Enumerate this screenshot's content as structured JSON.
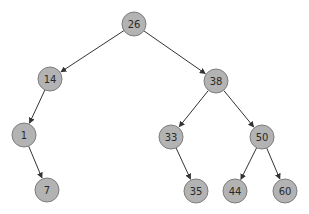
{
  "diagram": {
    "type": "binary-search-tree",
    "nodes": [
      {
        "id": "n26",
        "label": "26",
        "x": 134,
        "y": 24
      },
      {
        "id": "n14",
        "label": "14",
        "x": 50,
        "y": 79
      },
      {
        "id": "n38",
        "label": "38",
        "x": 216,
        "y": 81
      },
      {
        "id": "n1",
        "label": "1",
        "x": 24,
        "y": 135
      },
      {
        "id": "n33",
        "label": "33",
        "x": 171,
        "y": 137
      },
      {
        "id": "n50",
        "label": "50",
        "x": 262,
        "y": 137
      },
      {
        "id": "n7",
        "label": "7",
        "x": 47,
        "y": 190
      },
      {
        "id": "n35",
        "label": "35",
        "x": 196,
        "y": 191
      },
      {
        "id": "n44",
        "label": "44",
        "x": 235,
        "y": 191
      },
      {
        "id": "n60",
        "label": "60",
        "x": 285,
        "y": 191
      }
    ],
    "edges": [
      {
        "from": "n26",
        "to": "n14"
      },
      {
        "from": "n26",
        "to": "n38"
      },
      {
        "from": "n14",
        "to": "n1"
      },
      {
        "from": "n1",
        "to": "n7"
      },
      {
        "from": "n38",
        "to": "n33"
      },
      {
        "from": "n38",
        "to": "n50"
      },
      {
        "from": "n33",
        "to": "n35"
      },
      {
        "from": "n50",
        "to": "n44"
      },
      {
        "from": "n50",
        "to": "n60"
      }
    ],
    "node_radius": 12,
    "colors": {
      "node_fill": "#b3b3b3",
      "node_stroke": "#7d7d7d",
      "edge": "#333333",
      "text": "#2a2a2a"
    }
  }
}
